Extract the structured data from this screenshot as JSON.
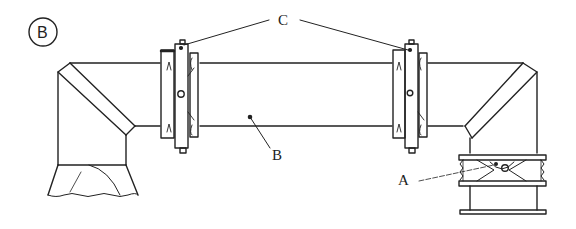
{
  "figure": {
    "panel_label": "B",
    "labels": {
      "a": "A",
      "b": "B",
      "c": "C"
    },
    "components": [
      {
        "id": "panel-marker",
        "name": "circled panel letter B"
      },
      {
        "id": "left-elbow",
        "name": "left 90-degree duct elbow with conical base"
      },
      {
        "id": "straight-duct",
        "name": "horizontal duct section B"
      },
      {
        "id": "left-coupling",
        "name": "flanged coupling C (left)"
      },
      {
        "id": "right-coupling",
        "name": "flanged coupling C (right)"
      },
      {
        "id": "right-elbow",
        "name": "right 90-degree duct elbow"
      },
      {
        "id": "damper",
        "name": "bellows/damper joint A"
      }
    ],
    "colors": {
      "line": "#222222",
      "background": "#ffffff"
    }
  }
}
